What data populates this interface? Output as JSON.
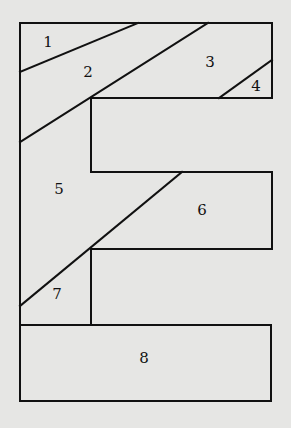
{
  "diagram": {
    "pieces": [
      {
        "id": "piece-1",
        "label": "1"
      },
      {
        "id": "piece-2",
        "label": "2"
      },
      {
        "id": "piece-3",
        "label": "3"
      },
      {
        "id": "piece-4",
        "label": "4"
      },
      {
        "id": "piece-5",
        "label": "5"
      },
      {
        "id": "piece-6",
        "label": "6"
      },
      {
        "id": "piece-7",
        "label": "7"
      },
      {
        "id": "piece-8",
        "label": "8"
      }
    ],
    "colors": {
      "background": "#e6e6e4",
      "line": "#111111"
    }
  }
}
